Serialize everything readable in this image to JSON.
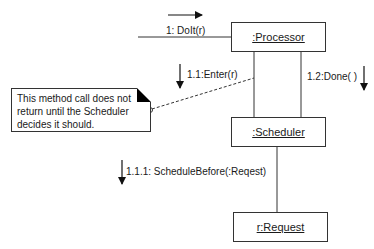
{
  "diagram": {
    "type": "UML collaboration diagram",
    "objects": [
      {
        "id": "processor",
        "label": ":Processor"
      },
      {
        "id": "scheduler",
        "label": ":Scheduler"
      },
      {
        "id": "request",
        "label": "r:Request"
      }
    ],
    "messages": [
      {
        "seq": "1",
        "label": "1: DoIt(r)",
        "direction": "right",
        "to": ":Processor"
      },
      {
        "seq": "1.1",
        "label": "1.1:Enter(r)",
        "direction": "down",
        "from": ":Processor",
        "to": ":Scheduler"
      },
      {
        "seq": "1.2",
        "label": "1.2:Done( )",
        "direction": "down",
        "from": ":Processor",
        "to": ":Scheduler"
      },
      {
        "seq": "1.1.1",
        "label": "1.1.1: ScheduleBefore(:Reqest)",
        "direction": "down",
        "from": ":Scheduler",
        "to": "r:Request"
      }
    ],
    "note": {
      "text": "This method call does not return until the Scheduler decides it should.",
      "attached_to": "1.1:Enter(r)"
    },
    "colors": {
      "line": "#333333",
      "background": "#ffffff",
      "text": "#1a1a1a"
    }
  }
}
